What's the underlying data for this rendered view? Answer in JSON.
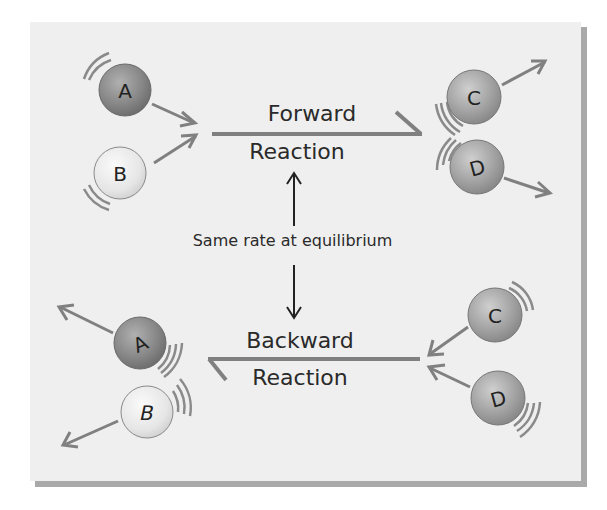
{
  "diagram": {
    "forward": {
      "line1": "Forward",
      "line2": "Reaction"
    },
    "backward": {
      "line1": "Backward",
      "line2": "Reaction"
    },
    "center_label": "Same rate at equilibrium",
    "molecules": {
      "top_left": [
        {
          "letter": "A",
          "shade": "dark"
        },
        {
          "letter": "B",
          "shade": "light"
        }
      ],
      "top_right": [
        {
          "letter": "C",
          "shade": "medium"
        },
        {
          "letter": "D",
          "shade": "medium"
        }
      ],
      "bottom_left": [
        {
          "letter": "A",
          "shade": "dark"
        },
        {
          "letter": "B",
          "shade": "light"
        }
      ],
      "bottom_right": [
        {
          "letter": "C",
          "shade": "medium"
        },
        {
          "letter": "D",
          "shade": "medium"
        }
      ]
    },
    "colors": {
      "panel": "#efefef",
      "shadow": "#a9a9a9",
      "arrow": "#808080",
      "text": "#2a2a2a"
    }
  }
}
